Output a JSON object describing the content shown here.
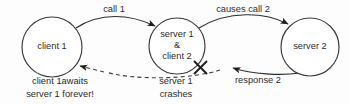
{
  "diagram": {
    "type": "sequence-failure-diagram",
    "background_color": "#fdfdfd",
    "stroke_color": "#2e2e2e",
    "nodes": [
      {
        "id": "client1",
        "lines": [
          "client 1"
        ],
        "cx": 52,
        "cy": 47,
        "r": 30
      },
      {
        "id": "server1client2",
        "lines": [
          "server 1",
          "&",
          "client 2"
        ],
        "cx": 177,
        "cy": 46,
        "r": 28
      },
      {
        "id": "server2",
        "lines": [
          "server 2"
        ],
        "cx": 310,
        "cy": 47,
        "r": 29
      }
    ],
    "edges": [
      {
        "id": "call1",
        "label": "call 1",
        "style": "solid",
        "from": "client1",
        "to": "server1client2",
        "label_x": 114,
        "label_y": 10
      },
      {
        "id": "causes-call2",
        "label": "causes call 2",
        "style": "solid",
        "from": "server1client2",
        "to": "server2",
        "label_x": 243,
        "label_y": 10
      },
      {
        "id": "response2",
        "label": "response 2",
        "style": "solid",
        "from": "server2",
        "to": "server1client2",
        "label_x": 258,
        "label_y": 80
      },
      {
        "id": "blocked-return",
        "label": "",
        "style": "dashed",
        "from": "server1client2",
        "to": "client1",
        "label_x": 0,
        "label_y": 0
      }
    ],
    "markers": [
      {
        "id": "crash-x",
        "name": "crash-x-mark",
        "x": 200,
        "y": 67,
        "size": 7
      }
    ],
    "notes": [
      {
        "id": "note-client1",
        "lines": [
          "client 1awaits",
          "server 1 forever!"
        ],
        "x": 60,
        "y": 82
      },
      {
        "id": "note-server1",
        "lines": [
          "server 1",
          "crashes"
        ],
        "x": 176,
        "y": 82
      }
    ]
  }
}
